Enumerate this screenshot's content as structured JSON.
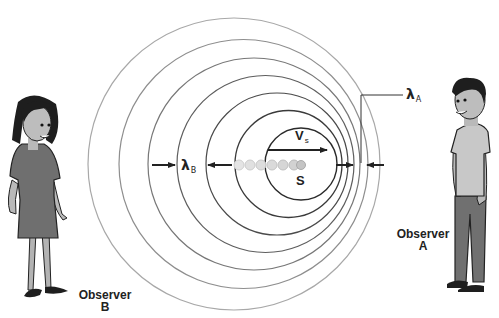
{
  "diagram": {
    "source": {
      "label": "S",
      "velocity_label": "V",
      "velocity_subscript": "s"
    },
    "wavelengths": {
      "behind": {
        "symbol": "λ",
        "subscript": "B"
      },
      "ahead": {
        "symbol": "λ",
        "subscript": "A"
      }
    },
    "observers": [
      {
        "id": "B",
        "line1": "Observer",
        "line2": "B",
        "side": "left"
      },
      {
        "id": "A",
        "line1": "Observer",
        "line2": "A",
        "side": "right"
      }
    ],
    "wavefronts": [
      {
        "cx": 234,
        "cy": 164,
        "r": 146
      },
      {
        "cx": 243.5,
        "cy": 164,
        "r": 124.5
      },
      {
        "cx": 254,
        "cy": 164,
        "r": 106
      },
      {
        "cx": 265.5,
        "cy": 164,
        "r": 88.5
      },
      {
        "cx": 277,
        "cy": 164,
        "r": 71
      },
      {
        "cx": 288.5,
        "cy": 164,
        "r": 53.5
      },
      {
        "cx": 301,
        "cy": 164,
        "r": 36
      }
    ],
    "source_positions_x": [
      239,
      250,
      261,
      272,
      283,
      294,
      301
    ],
    "colors": {
      "line": "#333333",
      "outer_line": "#9a9a9a",
      "dot": "#d6d6d6",
      "skin": "#b9b9b9",
      "hair": "#1e1e1e",
      "clothes_dark": "#6f6f6f",
      "clothes_light": "#c8c8c8"
    }
  }
}
